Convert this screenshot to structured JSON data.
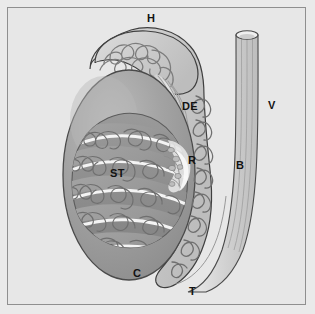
{
  "figure": {
    "background_color": "#e7e7e7",
    "frame_color": "#8f8f8f",
    "outline_color": "#3c3c3c"
  },
  "labels": [
    {
      "key": "H",
      "text": "H",
      "name": "head-of-epididymis",
      "x": 147,
      "y": 13
    },
    {
      "key": "DE",
      "text": "DE",
      "name": "ductuli-efferentes",
      "x": 182,
      "y": 101
    },
    {
      "key": "V",
      "text": "V",
      "name": "vas-deferens",
      "x": 268,
      "y": 100
    },
    {
      "key": "R",
      "text": "R",
      "name": "rete-testis",
      "x": 188,
      "y": 155
    },
    {
      "key": "B",
      "text": "B",
      "name": "body-of-epididymis",
      "x": 236,
      "y": 160
    },
    {
      "key": "ST",
      "text": "ST",
      "name": "seminiferous-tubules",
      "x": 110,
      "y": 168
    },
    {
      "key": "C",
      "text": "C",
      "name": "capsule-tunica-albuginea",
      "x": 133,
      "y": 268
    },
    {
      "key": "T",
      "text": "T",
      "name": "tail-of-epididymis",
      "x": 189,
      "y": 286
    }
  ],
  "structures": {
    "testis_capsule": {
      "name": "testis-capsule",
      "fill": "#9d9d9d"
    },
    "testis_cutaway": {
      "name": "testis-cutaway-window",
      "fill": "#8a8a8a"
    },
    "lobule": {
      "name": "testis-lobule",
      "fill": "#989898"
    },
    "septum": {
      "name": "mediastinum-septum",
      "fill": "#f2f2f2"
    },
    "tubule_line": {
      "name": "seminiferous-tubule-line",
      "stroke": "#6d6d6d"
    },
    "epididymis": {
      "name": "epididymis-duct",
      "fill": "#cfcfcf",
      "stroke": "#4a4a4a"
    },
    "efferent_ductules": {
      "name": "efferent-ductules",
      "fill": "#dcdcdc"
    },
    "vas_deferens": {
      "name": "vas-deferens-tube",
      "fill": "#d8d8d8",
      "stroke": "#4a4a4a"
    }
  }
}
